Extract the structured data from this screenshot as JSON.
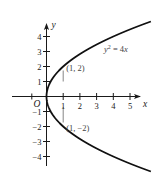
{
  "chart_data": {
    "type": "line",
    "title": "",
    "equation": "y^2 = 4x",
    "equation_parts": {
      "lhs_var": "y",
      "exp": "2",
      "rhs": " = 4",
      "rhs_var": "x"
    },
    "xlabel": "x",
    "ylabel": "y",
    "origin_label": "O",
    "xlim": [
      -0.5,
      5.5
    ],
    "ylim": [
      -4.6,
      4.6
    ],
    "x_ticks": [
      1,
      2,
      3,
      4,
      5
    ],
    "x_tick_labels": [
      "1",
      "2",
      "3",
      "4",
      "5"
    ],
    "y_ticks": [
      4,
      3,
      2,
      1,
      -1,
      -2,
      -3,
      -4
    ],
    "y_tick_labels": [
      "4",
      "3",
      "2",
      "1",
      "−1",
      "−2",
      "−3",
      "−4"
    ],
    "grid": false,
    "legend": null,
    "series": [
      {
        "name": "y^2 = 4x",
        "description": "parabola opening right, vertex at origin",
        "points": [
          {
            "x": 6.25,
            "y": 5
          },
          {
            "x": 4,
            "y": 4
          },
          {
            "x": 2.25,
            "y": 3
          },
          {
            "x": 1,
            "y": 2
          },
          {
            "x": 0.25,
            "y": 1
          },
          {
            "x": 0,
            "y": 0
          },
          {
            "x": 0.25,
            "y": -1
          },
          {
            "x": 1,
            "y": -2
          },
          {
            "x": 2.25,
            "y": -3
          },
          {
            "x": 4,
            "y": -4
          },
          {
            "x": 6.25,
            "y": -5
          }
        ]
      }
    ],
    "annotations": [
      {
        "text": "(1, 2)",
        "x": 1,
        "y": 2
      },
      {
        "text": "(1, −2)",
        "x": 1,
        "y": -2
      }
    ],
    "guide_lines": [
      {
        "type": "vertical-segment",
        "x": 1,
        "y_from": -2,
        "y_to": 2
      }
    ]
  }
}
